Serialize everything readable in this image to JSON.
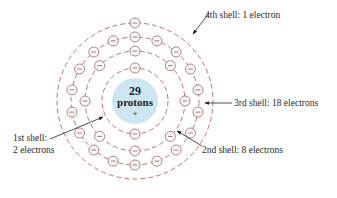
{
  "diagram": {
    "nucleus": {
      "count": "29",
      "label": "protons",
      "charge": "+",
      "color": "#cde6f2"
    },
    "shells": [
      {
        "name": "1st shell",
        "electrons": 2,
        "radius": 33
      },
      {
        "name": "2nd shell",
        "electrons": 8,
        "radius": 50
      },
      {
        "name": "3rd shell",
        "electrons": 18,
        "radius": 64
      },
      {
        "name": "4th shell",
        "electrons": 1,
        "radius": 78
      }
    ],
    "electron_symbol": "−",
    "colors": {
      "shell_line": "#b54b4b",
      "electron_stroke": "#a05a5a",
      "text": "#2a2a2a"
    },
    "labels": {
      "shell4": "4th shell: 1 electron",
      "shell3": "3rd shell: 18 electrons",
      "shell2": "2nd shell: 8 electrons",
      "shell1_line1": "1st shell:",
      "shell1_line2": "2 electrons"
    }
  }
}
